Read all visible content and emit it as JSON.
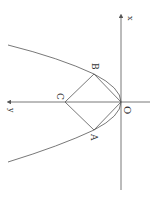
{
  "diagram": {
    "type": "parabola-with-inscribed-square",
    "orientation": "rotated 90° (x-axis vertical, y-axis horizontal)",
    "axes": {
      "x_label": "x",
      "y_label": "y",
      "origin_label": "O"
    },
    "points": {
      "A": "A",
      "B": "B",
      "C": "C",
      "O": "O"
    },
    "colors": {
      "stroke": "#555555",
      "background": "#ffffff"
    }
  }
}
